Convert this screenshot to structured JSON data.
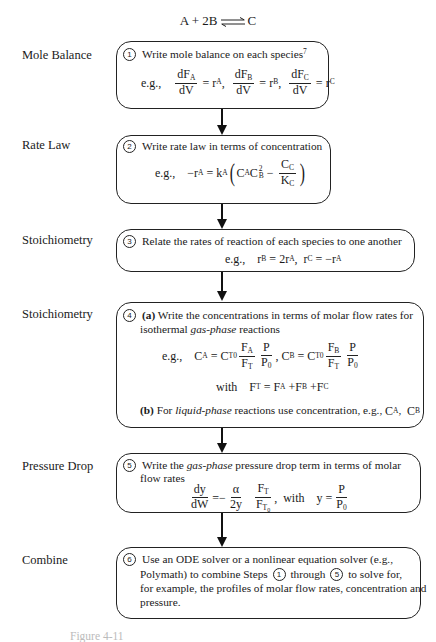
{
  "title": {
    "left": "A + 2B",
    "arrow": "reversible-arrow",
    "right": "C"
  },
  "steps": [
    {
      "number": "1",
      "label": "Mole Balance",
      "heading": "Write mole balance on each species",
      "heading_sup": "7",
      "example_prefix": "e.g.,",
      "equations": [
        {
          "num": "dF",
          "num_sub": "A",
          "den": "dV",
          "rhs": "r",
          "rhs_sub": "A"
        },
        {
          "num": "dF",
          "num_sub": "B",
          "den": "dV",
          "rhs": "r",
          "rhs_sub": "B"
        },
        {
          "num": "dF",
          "num_sub": "C",
          "den": "dV",
          "rhs": "r",
          "rhs_sub": "C"
        }
      ]
    },
    {
      "number": "2",
      "label": "Rate Law",
      "heading": "Write rate law in terms of concentration",
      "example_prefix": "e.g.,",
      "equation": {
        "lhs": "−r",
        "lhs_sub": "A",
        "k": "k",
        "k_sub": "A",
        "term1": "C",
        "term1_sub": "A",
        "term2": "C",
        "term2_sub": "B",
        "term2_sup": "2",
        "frac_num": "C",
        "frac_num_sub": "C",
        "frac_den": "K",
        "frac_den_sub": "C"
      }
    },
    {
      "number": "3",
      "label": "Stoichiometry",
      "heading": "Relate the rates of reaction of each species to one another",
      "example_prefix": "e.g.,",
      "equation_1": {
        "lhs": "r",
        "lhs_sub": "B",
        "rhs": "2r",
        "rhs_sub": "A"
      },
      "equation_2": {
        "lhs": "r",
        "lhs_sub": "C",
        "rhs": "−r",
        "rhs_sub": "A"
      }
    },
    {
      "number": "4",
      "label": "Stoichiometry",
      "part_a_tag": "(a)",
      "part_a_text_1": "Write the concentrations in terms of molar flow rates for",
      "part_a_text_2_pre": "isothermal",
      "part_a_text_2_em": "gas-phase",
      "part_a_text_2_post": "reactions",
      "example_prefix": "e.g.,",
      "eq_ca": {
        "lhs": "C",
        "lhs_sub": "A",
        "ct0": "C",
        "ct0_sub": "T0",
        "f_num": "F",
        "f_num_sub": "A",
        "f_den": "F",
        "f_den_sub": "T",
        "p_num": "P",
        "p_den": "P",
        "p_den_sub": "0"
      },
      "eq_cb": {
        "lhs": "C",
        "lhs_sub": "B",
        "ct0": "C",
        "ct0_sub": "T0",
        "f_num": "F",
        "f_num_sub": "B",
        "f_den": "F",
        "f_den_sub": "T",
        "p_num": "P",
        "p_den": "P",
        "p_den_sub": "0"
      },
      "with_label": "with",
      "ft_eq": {
        "lhs": "F",
        "lhs_sub": "T",
        "t1": "F",
        "t1_sub": "A",
        "t2": "F",
        "t2_sub": "B",
        "t3": "F",
        "t3_sub": "C"
      },
      "part_b_tag": "(b)",
      "part_b_pre": "For",
      "part_b_em": "liquid-phase",
      "part_b_post": "reactions use concentration, e.g.,",
      "part_b_c1": "C",
      "part_b_c1_sub": "A",
      "part_b_c2": "C",
      "part_b_c2_sub": "B"
    },
    {
      "number": "5",
      "label": "Pressure Drop",
      "heading_pre": "Write the",
      "heading_em": "gas-phase",
      "heading_post": "pressure drop term in terms of molar",
      "heading_line2": "flow rates",
      "equation": {
        "lhs_num": "dy",
        "lhs_den": "dW",
        "alpha_num": "α",
        "alpha_den": "2y",
        "ft_num": "F",
        "ft_num_sub": "T",
        "ft_den": "F",
        "ft_den_sub": "T",
        "ft_den_subsub": "0",
        "with_label": "with",
        "y": "y",
        "p_num": "P",
        "p_den": "P",
        "p_den_sub": "0"
      }
    },
    {
      "number": "6",
      "label": "Combine",
      "line_1": "Use an ODE solver or a nonlinear equation solver (e.g.,",
      "line_2_pre": "Polymath) to combine Steps",
      "line_2_ref1": "1",
      "line_2_mid": "through",
      "line_2_ref2": "5",
      "line_2_post": "to solve for,",
      "line_3": "for example, the profiles of molar flow rates, concentration and",
      "line_4": "pressure."
    }
  ],
  "caption": "Figure 4-11"
}
